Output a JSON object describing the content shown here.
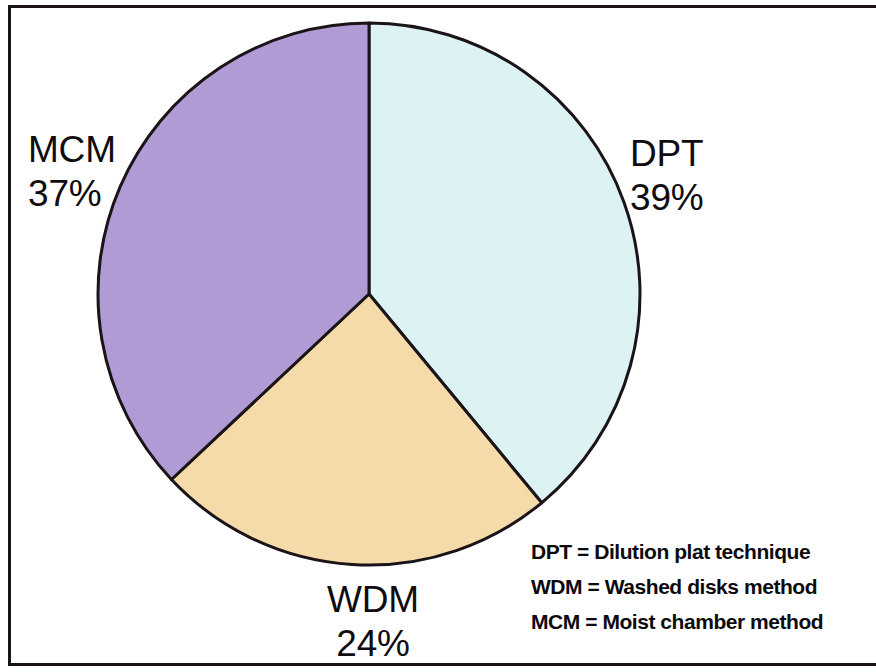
{
  "figure": {
    "background_color": "#ffffff",
    "frame_color": "#1a1418"
  },
  "chart_data": {
    "type": "pie",
    "title": "",
    "subtitle": "",
    "xlabel": "",
    "ylabel": "",
    "grid": false,
    "legend_position": "bottom-right",
    "start_angle_deg": 0,
    "direction": "clockwise",
    "categories": [
      "DPT",
      "WDM",
      "MCM"
    ],
    "values": [
      39,
      24,
      37
    ],
    "value_unit": "%",
    "colors": [
      "#ddf2f3",
      "#f5dbaa",
      "#b09bd4"
    ],
    "slice_edge_color": "#1a1418",
    "center": {
      "x": 369,
      "y": 294
    },
    "radius": 271,
    "slices": [
      {
        "key": "DPT",
        "label": "DPT",
        "percent_text": "39%",
        "value": 39,
        "color": "#ddf2f3",
        "start_deg": 0,
        "end_deg": 140.4,
        "label_position": "outside-right"
      },
      {
        "key": "WDM",
        "label": "WDM",
        "percent_text": "24%",
        "value": 24,
        "color": "#f5dbaa",
        "start_deg": 140.4,
        "end_deg": 226.8,
        "label_position": "outside-bottom"
      },
      {
        "key": "MCM",
        "label": "MCM",
        "percent_text": "37%",
        "value": 37,
        "color": "#b09bd4",
        "start_deg": 226.8,
        "end_deg": 360,
        "label_position": "outside-left"
      }
    ],
    "annotations": [
      "DPT = Dilution plat technique",
      "WDM = Washed disks method",
      "MCM = Moist chamber method"
    ]
  },
  "labels": {
    "mcm": {
      "name": "MCM",
      "percent": "37%"
    },
    "dpt": {
      "name": "DPT",
      "percent": "39%"
    },
    "wdm": {
      "name": "WDM",
      "percent": "24%"
    }
  },
  "legend": {
    "rows": [
      {
        "abbr": "DPT",
        "text": "DPT = Dilution plat technique"
      },
      {
        "abbr": "WDM",
        "text": "WDM = Washed disks method"
      },
      {
        "abbr": "MCM",
        "text": "MCM = Moist chamber method"
      }
    ]
  }
}
